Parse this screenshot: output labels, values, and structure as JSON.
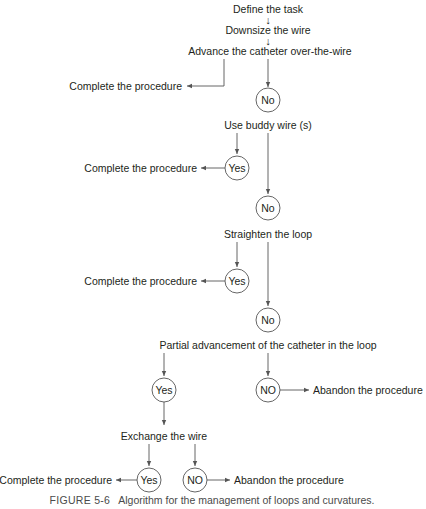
{
  "diagram": {
    "steps": {
      "define_task": "Define the task",
      "downsize_wire": "Downsize the wire",
      "advance_catheter": "Advance the catheter over-the-wire",
      "use_buddy_wire": "Use buddy wire (s)",
      "straighten_loop": "Straighten the loop",
      "partial_advancement": "Partial advancement of the catheter in the loop",
      "exchange_wire": "Exchange the wire"
    },
    "small_arrow_glyph": "↓",
    "outcomes": {
      "complete_1": "Complete the procedure",
      "complete_2": "Complete the procedure",
      "complete_3": "Complete the procedure",
      "complete_4": "Complete the procedure",
      "abandon_1": "Abandon the procedure",
      "abandon_2": "Abandon the procedure"
    },
    "decisions": {
      "no_1": "No",
      "yes_1": "Yes",
      "no_2": "No",
      "yes_2": "Yes",
      "no_3": "No",
      "yes_3": "Yes",
      "no_4": "NO",
      "yes_4": "Yes",
      "no_5": "NO"
    }
  },
  "caption": {
    "label": "FIGURE 5-6",
    "text": "Algorithm for the management of loops and curvatures."
  }
}
